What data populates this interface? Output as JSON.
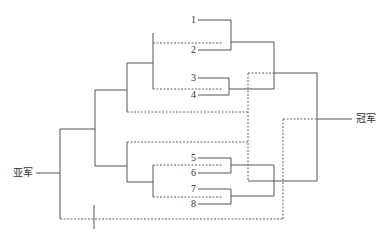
{
  "diagram": {
    "type": "double-elimination tournament bracket",
    "participants": [
      "1",
      "2",
      "3",
      "4",
      "5",
      "6",
      "7",
      "8"
    ],
    "labels": {
      "champion": "冠军",
      "runner_up": "亚军"
    },
    "line_styles": {
      "winners_bracket": "solid",
      "losers_bracket": "dashed"
    },
    "colors": {
      "line": "#555555",
      "text": "#333333",
      "background": "#ffffff"
    }
  }
}
